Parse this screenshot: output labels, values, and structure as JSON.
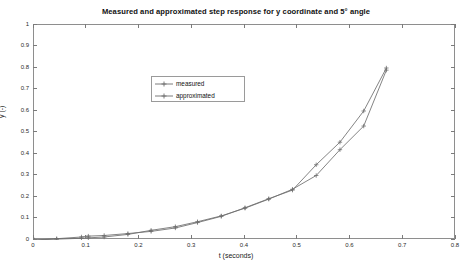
{
  "chart_data": {
    "type": "line",
    "title": "Measured and approximated step response for y coordinate and 5° angle",
    "xlabel": "t (seconds)",
    "ylabel": "y (-)",
    "xlim": [
      0,
      0.8
    ],
    "ylim": [
      0,
      1
    ],
    "xticks": [
      0,
      0.1,
      0.2,
      0.3,
      0.4,
      0.5,
      0.6,
      0.7,
      0.8
    ],
    "xticklabels": [
      "0",
      "0.1",
      "0.2",
      "0.3",
      "0.4",
      "0.5",
      "0.6",
      "0.7",
      "0.8"
    ],
    "yticks": [
      0,
      0.1,
      0.2,
      0.3,
      0.4,
      0.5,
      0.6,
      0.7,
      0.8,
      0.9,
      1
    ],
    "yticklabels": [
      "0",
      "0.1",
      "0.2",
      "0.3",
      "0.4",
      "0.5",
      "0.6",
      "0.7",
      "0.8",
      "0.9",
      "1"
    ],
    "grid": false,
    "legend_position": "upper center",
    "line_color": "#6e6e6e",
    "marker": "plus",
    "series": [
      {
        "name": "measured",
        "color": "#6e6e6e",
        "x": [
          0.0,
          0.043,
          0.09,
          0.103,
          0.133,
          0.178,
          0.222,
          0.268,
          0.31,
          0.355,
          0.4,
          0.445,
          0.49,
          0.535,
          0.58,
          0.625,
          0.668
        ],
        "y": [
          0.0,
          0.006,
          0.014,
          0.018,
          0.021,
          0.03,
          0.04,
          0.056,
          0.081,
          0.11,
          0.15,
          0.192,
          0.232,
          0.35,
          0.455,
          0.6,
          0.8
        ]
      },
      {
        "name": "approximated",
        "color": "#6e6e6e",
        "x": [
          0.0,
          0.043,
          0.09,
          0.103,
          0.133,
          0.178,
          0.222,
          0.268,
          0.31,
          0.355,
          0.4,
          0.445,
          0.49,
          0.535,
          0.58,
          0.625,
          0.668
        ],
        "y": [
          0.0,
          0.004,
          0.008,
          0.01,
          0.014,
          0.026,
          0.045,
          0.062,
          0.085,
          0.112,
          0.148,
          0.19,
          0.236,
          0.3,
          0.42,
          0.53,
          0.79
        ]
      }
    ]
  },
  "legend": {
    "items": [
      {
        "label": "measured"
      },
      {
        "label": "approximated"
      }
    ]
  }
}
